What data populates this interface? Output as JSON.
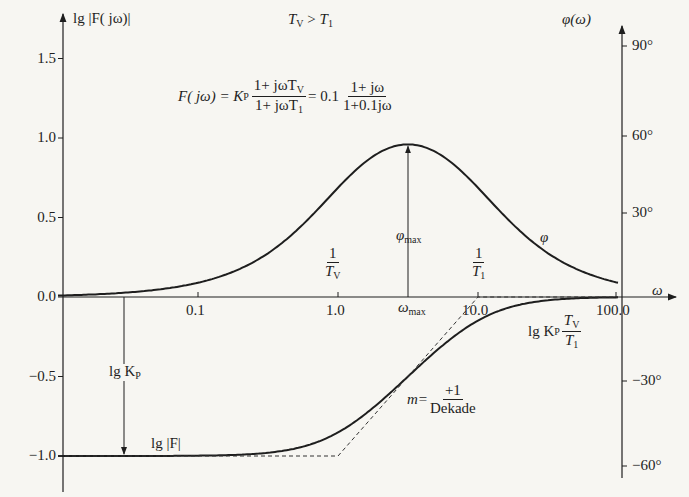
{
  "chart_data": {
    "type": "line",
    "condition": "T_V > T_1",
    "formula": {
      "lhs": "F( jω) = K_P (1+ jωT_V)/(1+ jωT_1) = 0.1 (1+ jω)/(1+0.1jω)",
      "K_P": 0.1,
      "T_V": 1.0,
      "T_1": 0.1
    },
    "xlabel": "ω",
    "x_scale": "log",
    "x_ticks": [
      0.1,
      1.0,
      10.0,
      100.0
    ],
    "xlim": [
      0.01,
      100
    ],
    "left_axis": {
      "label": "lg |F( jω)|",
      "ticks": [
        1.5,
        1.0,
        0.5,
        0.0,
        -0.5,
        -1.0
      ],
      "ylim": [
        -1.1,
        1.6
      ]
    },
    "right_axis": {
      "label": "φ(ω)",
      "ticks": [
        "90°",
        "60°",
        "30°",
        "-30°",
        "-60°"
      ],
      "ylim_deg": [
        -65,
        92
      ]
    },
    "series": [
      {
        "name": "lg |F|",
        "axis": "left",
        "style": "solid",
        "x": [
          0.01,
          0.03,
          0.1,
          0.3,
          1.0,
          2.0,
          3.16,
          5.0,
          10.0,
          30.0,
          100.0
        ],
        "values": [
          -1.0,
          -1.0,
          -0.998,
          -0.98,
          -0.85,
          -0.65,
          -0.5,
          -0.33,
          -0.15,
          -0.03,
          0.0
        ]
      },
      {
        "name": "asymptote",
        "axis": "left",
        "style": "dashed",
        "x": [
          0.01,
          1.0,
          10.0,
          100.0
        ],
        "values": [
          -1.0,
          -1.0,
          0.0,
          0.0
        ]
      },
      {
        "name": "φ",
        "axis": "right",
        "style": "solid",
        "x": [
          0.01,
          0.03,
          0.1,
          0.3,
          1.0,
          2.0,
          3.16,
          5.0,
          10.0,
          30.0,
          100.0
        ],
        "values_deg": [
          0.5,
          1.5,
          5.1,
          14.4,
          39.3,
          52.1,
          54.9,
          52.1,
          39.3,
          14.4,
          5.1
        ]
      }
    ],
    "annotations": [
      {
        "text": "1/T_V",
        "x": 1.0
      },
      {
        "text": "1/T_1",
        "x": 10.0
      },
      {
        "text": "ω_max",
        "x": 3.16
      },
      {
        "text": "φ_max",
        "value_deg": 54.9
      },
      {
        "text": "lg K_P",
        "x": 0.027,
        "from": 0.0,
        "to": -1.0
      },
      {
        "text": "lg |F|"
      },
      {
        "text": "lg K_P T_V/T_1"
      },
      {
        "text": "m = +1/Dekade"
      },
      {
        "text": "φ"
      }
    ],
    "grid": false,
    "legend": null
  },
  "labels": {
    "left_axis_title": "lg |F( jω)|",
    "right_axis_title": "φ(ω)",
    "x_axis_title": "ω",
    "condition_lhs": "T",
    "condition_lhs_sub": "V",
    "condition_op": " > ",
    "condition_rhs": "T",
    "condition_rhs_sub": "1",
    "formula_F": "F( jω) = K",
    "formula_P": "P",
    "formula_num1": "1+ jωT",
    "formula_num1_sub": "V",
    "formula_den1": "1+ jωT",
    "formula_den1_sub": "1",
    "formula_eq": "= 0.1",
    "formula_num2": "1+ jω",
    "formula_den2": "1+0.1jω",
    "one": "1",
    "tv": "T",
    "tv_sub": "V",
    "t1": "T",
    "t1_sub": "1",
    "omega_max": "ω",
    "omega_max_sub": "max",
    "phi_max": "φ",
    "phi_max_sub": "max",
    "phi_curve": "φ",
    "lgkp": "lg K",
    "lgkp_sub": "P",
    "lgF": "lg |F|",
    "lgkp_ratio": "lg K",
    "lgkp_ratio_sub": "P",
    "slope_m": "m=",
    "slope_num": "+1",
    "slope_den": "Dekade",
    "yl_ticks": [
      "1.5",
      "1.0",
      "0.5",
      "0.0",
      "−0.5",
      "−1.0"
    ],
    "x_ticks": [
      "0.1",
      "1.0",
      "10.0",
      "100.0"
    ],
    "yr_ticks": [
      "90°",
      "60°",
      "30°",
      "−30°",
      "−60°"
    ]
  },
  "colors": {
    "ink": "#1e1e1e",
    "paper": "#f7f6f2",
    "dash": "#333333"
  }
}
